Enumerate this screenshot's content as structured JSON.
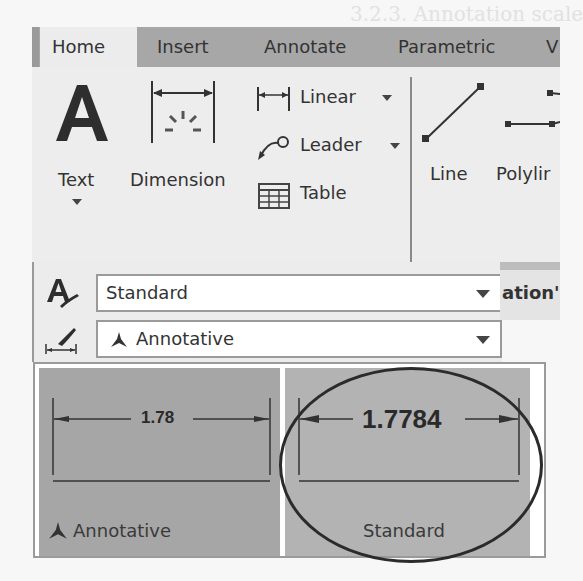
{
  "ribbon": {
    "tabs": [
      {
        "label": "Home",
        "active": true
      },
      {
        "label": "Insert",
        "active": false
      },
      {
        "label": "Annotate",
        "active": false
      },
      {
        "label": "Parametric",
        "active": false
      },
      {
        "label": "V",
        "active": false
      }
    ],
    "annotation_panel": {
      "text_button": {
        "label": "Text"
      },
      "dimension_button": {
        "label": "Dimension"
      },
      "linear_button": {
        "label": "Linear"
      },
      "leader_button": {
        "label": "Leader"
      },
      "table_button": {
        "label": "Table"
      }
    },
    "draw_panel": {
      "line_button": {
        "label": "Line"
      },
      "polyline_button": {
        "label": "Polylir"
      }
    }
  },
  "style_panel": {
    "text_style": {
      "value": "Standard"
    },
    "dim_style": {
      "value": "Annotative",
      "icon": "annotative-icon"
    },
    "overflow_label": "ation'"
  },
  "dim_style_gallery": {
    "items": [
      {
        "name": "Annotative",
        "value": "1.78",
        "icon": "annotative-icon",
        "selected": false
      },
      {
        "name": "Standard",
        "value": "1.7784",
        "selected": false,
        "highlighted_by_circle": true
      }
    ]
  },
  "colors": {
    "tab_bar": "#a7a7a7",
    "active_tab": "#ececec",
    "ribbon_bg": "#ededed",
    "tile_annotative": "#a6a6a6",
    "tile_standard": "#b3b3b3",
    "circle": "#2b2b2b"
  }
}
